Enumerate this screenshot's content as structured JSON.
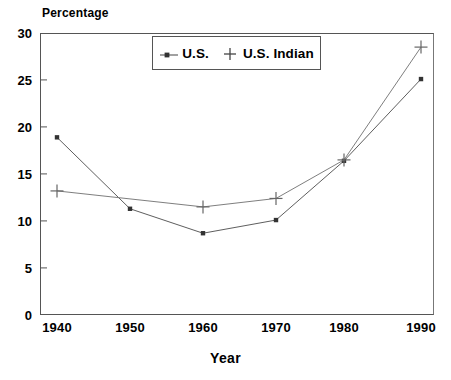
{
  "chart_data": {
    "type": "line",
    "title": "",
    "ylabel": "Percentage",
    "xlabel": "Year",
    "x": [
      1940,
      1950,
      1960,
      1970,
      1980,
      1990
    ],
    "xticklabels": [
      "1940",
      "1950",
      "1960",
      "1970",
      "1980",
      "1990"
    ],
    "yticks": [
      0,
      5,
      10,
      15,
      20,
      25,
      30
    ],
    "yticklabels": [
      "0",
      "5",
      "10",
      "15",
      "20",
      "25",
      "30"
    ],
    "ylim": [
      0,
      30
    ],
    "xlim": [
      1937,
      1992
    ],
    "grid": false,
    "legend_position": "upper center inside",
    "series": [
      {
        "name": "U.S.",
        "marker": "square-dot",
        "color": "#444444",
        "values": [
          18.9,
          11.3,
          8.7,
          10.1,
          16.4,
          25.1
        ]
      },
      {
        "name": "U.S. Indian",
        "marker": "plus",
        "color": "#888888",
        "values": [
          13.2,
          null,
          11.5,
          12.4,
          16.5,
          28.5
        ]
      }
    ],
    "annotations": []
  },
  "legend": {
    "entries": [
      {
        "label": "U.S.",
        "marker": "dot-line-marker"
      },
      {
        "label": "U.S. Indian",
        "marker": "plus-marker"
      }
    ]
  },
  "colors": {
    "axis": "#555555",
    "us_line": "#555555",
    "indian_line": "#777777",
    "text": "#000000",
    "background": "#ffffff"
  }
}
